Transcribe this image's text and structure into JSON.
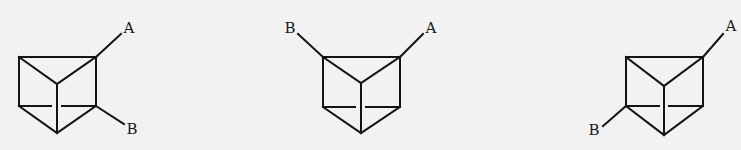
{
  "figure": {
    "background_color": "#f2f2f2",
    "line_color": "#141414",
    "structures": [
      {
        "id": "isomer-1",
        "substituents": [
          {
            "label": "A",
            "position": "top-right vertex"
          },
          {
            "label": "B",
            "position": "bottom-right vertex"
          }
        ]
      },
      {
        "id": "isomer-2",
        "substituents": [
          {
            "label": "B",
            "position": "top-left vertex"
          },
          {
            "label": "A",
            "position": "top-right vertex"
          }
        ]
      },
      {
        "id": "isomer-3",
        "substituents": [
          {
            "label": "A",
            "position": "top-right vertex"
          },
          {
            "label": "B",
            "position": "bottom-left vertex"
          }
        ]
      }
    ]
  }
}
